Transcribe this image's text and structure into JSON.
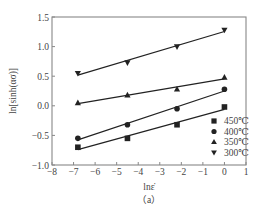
{
  "chart_data": {
    "type": "scatter",
    "title": "",
    "xlabel": "lnε̇",
    "ylabel": "ln[sinh(ασ)]",
    "caption": "（a）",
    "xlim": [
      -8,
      1
    ],
    "ylim": [
      -1.0,
      1.5
    ],
    "xticks": [
      "−8",
      "−7",
      "−6",
      "−5",
      "−4",
      "−3",
      "−2",
      "−1",
      "0",
      "1"
    ],
    "yticks": [
      "−1.0",
      "−0.5",
      "0.0",
      "0.5",
      "1.0",
      "1.5"
    ],
    "grid": false,
    "legend_position": "lower right",
    "fit_lines": true,
    "x": [
      -6.8,
      -4.5,
      -2.2,
      0
    ],
    "series": [
      {
        "name": "450℃",
        "marker": "square",
        "values": [
          -0.7,
          -0.55,
          -0.32,
          -0.02
        ]
      },
      {
        "name": "400℃",
        "marker": "circle",
        "values": [
          -0.55,
          -0.32,
          -0.05,
          0.28
        ]
      },
      {
        "name": "350℃",
        "marker": "triangle-up",
        "values": [
          0.05,
          0.18,
          0.28,
          0.48
        ]
      },
      {
        "name": "300℃",
        "marker": "triangle-down",
        "values": [
          0.55,
          0.73,
          1.0,
          1.28
        ]
      }
    ]
  },
  "colors": {
    "axis": "#888888",
    "series": "#222222"
  }
}
